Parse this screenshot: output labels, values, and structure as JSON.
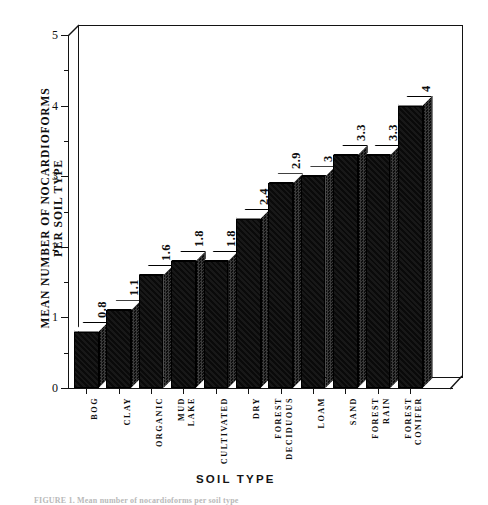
{
  "figure": {
    "caption": "FIGURE 1. Mean number of nocardioforms per soil type"
  },
  "axes": {
    "ylabel": "MEAN NUMBER OF NOCARDIOFORMS\nPER SOIL TYPE",
    "xlabel": "SOIL  TYPE",
    "y_ticks_major": [
      "0",
      "1",
      "2",
      "3",
      "4",
      "5"
    ],
    "y_ticks_minor": [
      "0.5",
      "1.5",
      "2.5",
      "3.5",
      "4.5"
    ]
  },
  "chart_data": {
    "type": "bar",
    "title": "",
    "xlabel": "SOIL TYPE",
    "ylabel": "MEAN NUMBER OF NOCARDIOFORMS PER SOIL TYPE",
    "ylim": [
      0,
      5
    ],
    "ytick_step": 1,
    "yminor_step": 0.5,
    "grid": false,
    "legend": false,
    "style": "3d-bar",
    "bar_color": "#111111",
    "bar_top_color": "#ffffff",
    "bar_side_color": "#3a3a3a",
    "categories": [
      "BOG",
      "CLAY",
      "ORGANIC",
      "LAKE MUD",
      "CULTIVATED",
      "DRY",
      "DECIDUOUS FOREST",
      "LOAM",
      "SAND",
      "RAIN FOREST",
      "CONIFER FOREST"
    ],
    "values": [
      0.8,
      1.1,
      1.6,
      1.8,
      1.8,
      2.4,
      2.9,
      3,
      3.3,
      3.3,
      4
    ],
    "value_labels": [
      "0.8",
      "1.1",
      "1.6",
      "1.8",
      "1.8",
      "2.4",
      "2.9",
      "3",
      "3.3",
      "3.3",
      "4"
    ]
  }
}
